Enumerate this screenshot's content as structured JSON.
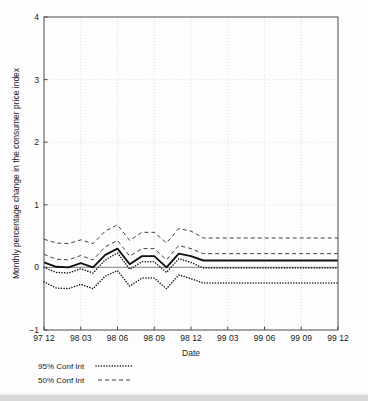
{
  "figure": {
    "background": "#fdfdfd",
    "frame_color": "#4a4a4a",
    "grid_color": "#cfcfcf"
  },
  "axes": {
    "xlabel": "Date",
    "ylabel": "Monthly percentage change in the consumer price index",
    "ytick_labels": [
      "4",
      "3",
      "2",
      "1",
      "0",
      "−1"
    ],
    "xtick_labels": [
      "97 12",
      "98 03",
      "98 06",
      "98 09",
      "98 12",
      "99 03",
      "99 06",
      "99 09",
      "99 12"
    ]
  },
  "legend": {
    "entries": [
      {
        "label": "95% Conf Int",
        "style": "dotted"
      },
      {
        "label": "50% Conf Int",
        "style": "dashed"
      }
    ]
  },
  "chart_data": {
    "type": "line",
    "title": "",
    "subtitle": "",
    "xlabel": "Date",
    "ylabel": "Monthly percentage change in the consumer price index",
    "xlim": [
      0,
      24
    ],
    "ylim": [
      -1,
      4
    ],
    "yticks": [
      -1,
      0,
      1,
      2,
      3,
      4
    ],
    "grid": true,
    "legend_position": "below-axes-left",
    "x": [
      "97 12",
      "98 01",
      "98 02",
      "98 03",
      "98 04",
      "98 05",
      "98 06",
      "98 07",
      "98 08",
      "98 09",
      "98 10",
      "98 11",
      "98 12",
      "99 01",
      "99 02",
      "99 03",
      "99 04",
      "99 05",
      "99 06",
      "99 07",
      "99 08",
      "99 09",
      "99 10",
      "99 11",
      "99 12"
    ],
    "xtick_indices": [
      0,
      3,
      6,
      9,
      12,
      15,
      18,
      21,
      24
    ],
    "xtick_labels": [
      "97 12",
      "98 03",
      "98 06",
      "98 09",
      "98 12",
      "99 03",
      "99 06",
      "99 09",
      "99 12"
    ],
    "series": [
      {
        "name": "Central projection",
        "style": "solid",
        "color": "#111111",
        "values": [
          0.08,
          0.01,
          0.0,
          0.07,
          0.0,
          0.2,
          0.3,
          0.05,
          0.18,
          0.18,
          0.0,
          0.22,
          0.18,
          0.11,
          0.11,
          0.11,
          0.11,
          0.11,
          0.11,
          0.11,
          0.11,
          0.11,
          0.11,
          0.11,
          0.11
        ]
      },
      {
        "name": "50% Conf Int upper",
        "style": "dashed",
        "color": "#2a2a2a",
        "values": [
          0.45,
          0.39,
          0.38,
          0.44,
          0.38,
          0.58,
          0.68,
          0.43,
          0.56,
          0.56,
          0.39,
          0.62,
          0.58,
          0.47,
          0.47,
          0.47,
          0.47,
          0.47,
          0.47,
          0.47,
          0.47,
          0.47,
          0.47,
          0.47,
          0.47
        ]
      },
      {
        "name": "50% Conf Int lower",
        "style": "dashed",
        "color": "#2a2a2a",
        "values": [
          0.21,
          0.13,
          0.12,
          0.19,
          0.12,
          0.33,
          0.43,
          0.18,
          0.3,
          0.3,
          0.12,
          0.35,
          0.3,
          0.22,
          0.22,
          0.22,
          0.22,
          0.22,
          0.22,
          0.22,
          0.22,
          0.22,
          0.22,
          0.22,
          0.22
        ]
      },
      {
        "name": "95% Conf Int upper",
        "style": "dotted",
        "color": "#111111",
        "values": [
          0.0,
          -0.08,
          -0.09,
          -0.02,
          -0.09,
          0.12,
          0.23,
          -0.03,
          0.09,
          0.09,
          -0.08,
          0.14,
          0.08,
          -0.01,
          -0.01,
          -0.01,
          -0.01,
          -0.01,
          -0.01,
          -0.01,
          -0.01,
          -0.01,
          -0.01,
          -0.01,
          -0.01
        ]
      },
      {
        "name": "95% Conf Int lower",
        "style": "dotted",
        "color": "#111111",
        "values": [
          -0.23,
          -0.33,
          -0.34,
          -0.27,
          -0.34,
          -0.14,
          -0.05,
          -0.3,
          -0.17,
          -0.17,
          -0.34,
          -0.12,
          -0.18,
          -0.25,
          -0.25,
          -0.25,
          -0.25,
          -0.25,
          -0.25,
          -0.25,
          -0.25,
          -0.25,
          -0.25,
          -0.25,
          -0.25
        ]
      }
    ],
    "annotations": [
      {
        "text": "zero reference line",
        "y": 0
      }
    ]
  }
}
